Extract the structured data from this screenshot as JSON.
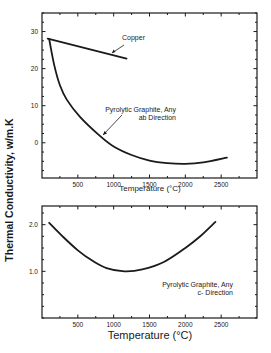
{
  "figure": {
    "shared_ylabel": "Thermal Conductivity, w/m.K"
  },
  "chart_data": [
    {
      "type": "line",
      "title": "",
      "xlabel": "Temperature (°C)",
      "ylabel": "Thermal Conductivity, w/m.K",
      "xlim": [
        0,
        3000
      ],
      "ylim": [
        -9.5,
        35
      ],
      "xticks": [
        500,
        1000,
        1500,
        2000,
        2500
      ],
      "yticks": [
        0,
        10,
        20,
        30
      ],
      "ytick_labels": [
        "0",
        "10",
        "20",
        "30"
      ],
      "grid": false,
      "legend": "none (inline annotations)",
      "series": [
        {
          "name": "Copper",
          "x": [
            80,
            1180
          ],
          "y": [
            28.1,
            22.7
          ]
        },
        {
          "name": "Pyrolytic Graphite, Any ab Direction",
          "x": [
            100,
            170,
            250,
            350,
            530,
            800,
            1000,
            1250,
            1500,
            1750,
            2000,
            2250,
            2580
          ],
          "y": [
            28,
            21,
            15.5,
            11.5,
            7,
            2,
            -1,
            -3.3,
            -4.8,
            -5.5,
            -5.7,
            -5.3,
            -4
          ]
        }
      ],
      "annotations": [
        {
          "text": "Copper",
          "arrow_to": [
            970,
            24
          ]
        },
        {
          "text": "Pyrolytic Graphite, Any",
          "text2": "ab Direction",
          "arrow_to": [
            850,
            2
          ]
        }
      ]
    },
    {
      "type": "line",
      "title": "",
      "xlabel": "Temperature (°C)",
      "ylabel": "Thermal Conductivity, w/m.K",
      "xlim": [
        0,
        3000
      ],
      "ylim": [
        0,
        2.4
      ],
      "xticks": [
        500,
        1000,
        1500,
        2000,
        2500
      ],
      "yticks": [
        1.0,
        2.0
      ],
      "ytick_labels": [
        "1.0",
        "2.0"
      ],
      "grid": false,
      "legend": "none (inline annotations)",
      "series": [
        {
          "name": "Pyrolytic Graphite, Any c- Direction",
          "x": [
            100,
            300,
            500,
            700,
            900,
            1150,
            1400,
            1700,
            2000,
            2200,
            2420
          ],
          "y": [
            2.04,
            1.73,
            1.45,
            1.23,
            1.07,
            1.0,
            1.04,
            1.2,
            1.5,
            1.74,
            2.06
          ]
        }
      ],
      "annotations": [
        {
          "text": "Pyrolytic Graphite, Any",
          "text2": "c- Direction"
        }
      ]
    }
  ]
}
